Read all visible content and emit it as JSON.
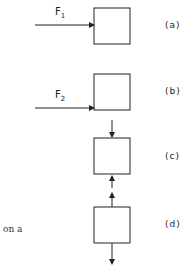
{
  "diagram": {
    "panels": [
      {
        "id": "a",
        "label": "(a)",
        "force_label": "F",
        "force_subscript": "1",
        "force_direction": "right, horizontal into left side of block"
      },
      {
        "id": "b",
        "label": "(b)",
        "force_label": "F",
        "force_subscript": "2",
        "force_direction": "right, horizontal into lower-left corner of block"
      },
      {
        "id": "c",
        "label": "(c)",
        "force_direction": "down into top of block; up from bottom of block"
      },
      {
        "id": "d",
        "label": "(d)",
        "force_direction": "up from top of block; down from bottom of block"
      }
    ],
    "caption_fragment": "on a",
    "colors": {
      "stroke": "#222222",
      "background": "#ffffff"
    }
  }
}
